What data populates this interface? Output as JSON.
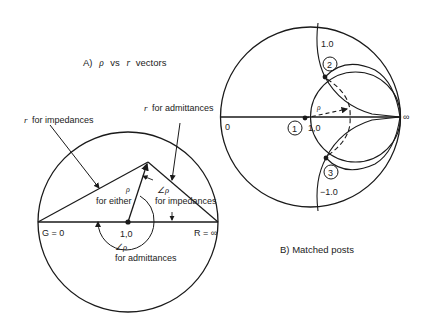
{
  "figure_a": {
    "title": "A)  ρ  vs  r  vectors",
    "title_parts": {
      "prefix": "A)",
      "rho": "ρ",
      "vs": "vs",
      "r": "r",
      "suffix": "vectors"
    },
    "labels": {
      "r_impedances": "for impedances",
      "r_admittances": "for admittances",
      "r_symbol": "r",
      "rho_symbol": "ρ",
      "for_either": "for either",
      "angle_rho": "∠ρ",
      "angle_for_impedances": "for impedances",
      "angle_rho_bottom": "∠ρ",
      "angle_for_admittances": "for admittances",
      "g_zero": "G = 0",
      "center": "1,0",
      "r_infinity": "R = ∞"
    }
  },
  "figure_b": {
    "title": "B)  Matched posts",
    "labels": {
      "zero": "0",
      "infinity": "∞",
      "center": "1,0",
      "plus_one": "1.0",
      "minus_one": "−1.0",
      "rho": "ρ",
      "point_1": "1",
      "point_2": "2",
      "point_3": "3"
    }
  },
  "colors": {
    "line": "#1a1a1a",
    "background": "#ffffff"
  }
}
